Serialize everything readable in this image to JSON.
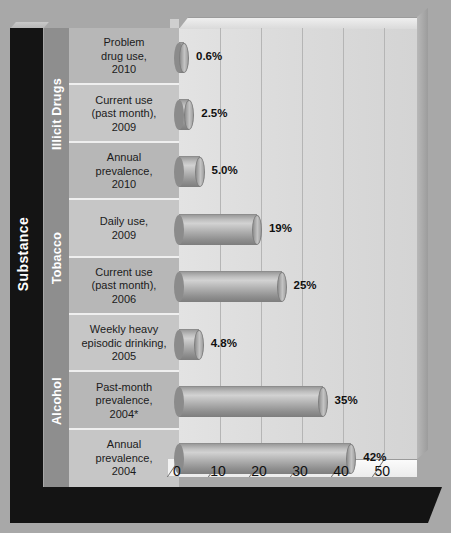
{
  "axis_titles": {
    "y_axis": "Substance"
  },
  "groups": [
    {
      "label": "Illicit Drugs",
      "rows": 3
    },
    {
      "label": "Tobacco",
      "rows": 2
    },
    {
      "label": "Alcohol",
      "rows": 3
    }
  ],
  "colors": {
    "frame": "#141414",
    "group_strip": "#8e8e8e",
    "row_shade_a": "#b7b7b7",
    "row_shade_b": "#c6c6c6",
    "plot_background": "#dcdcdc",
    "bar": "#a9a9a9",
    "text": "#101010",
    "page_background": "#a8a8a8"
  },
  "chart_data": {
    "type": "bar",
    "orientation": "horizontal",
    "title": "",
    "xlabel": "",
    "ylabel": "Substance",
    "xlim": [
      0,
      58
    ],
    "grid": true,
    "legend": "none",
    "xticks": [
      "0",
      "10",
      "20",
      "30",
      "40",
      "50"
    ],
    "xtick_values": [
      0,
      10,
      20,
      30,
      40,
      50
    ],
    "categories": [
      "Problem drug use, 2010",
      "Current use (past month), 2009",
      "Annual prevalence, 2010",
      "Daily use, 2009",
      "Current use (past month), 2006",
      "Weekly heavy episodic drinking, 2005",
      "Past-month prevalence, 2004*",
      "Annual prevalence, 2004"
    ],
    "category_lines": [
      [
        "Problem",
        "drug use,",
        "2010"
      ],
      [
        "Current use",
        "(past month),",
        "2009"
      ],
      [
        "Annual",
        "prevalence,",
        "2010"
      ],
      [
        "Daily use,",
        "2009"
      ],
      [
        "Current use",
        "(past month),",
        "2006"
      ],
      [
        "Weekly heavy",
        "episodic drinking,",
        "2005"
      ],
      [
        "Past-month",
        "prevalence,",
        "2004*"
      ],
      [
        "Annual",
        "prevalence,",
        "2004"
      ]
    ],
    "groups_of_category": [
      "Illicit Drugs",
      "Illicit Drugs",
      "Illicit Drugs",
      "Tobacco",
      "Tobacco",
      "Alcohol",
      "Alcohol",
      "Alcohol"
    ],
    "values": [
      0.6,
      2.5,
      5.0,
      19,
      25,
      4.8,
      35,
      42
    ],
    "value_labels": [
      "0.6%",
      "2.5%",
      "5.0%",
      "19%",
      "25%",
      "4.8%",
      "35%",
      "42%"
    ]
  }
}
